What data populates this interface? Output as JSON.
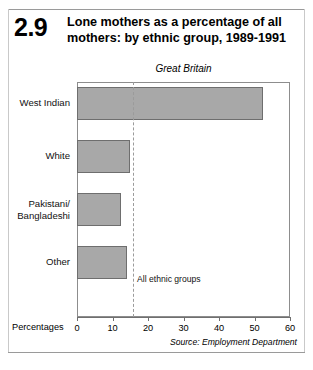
{
  "figure": {
    "number": "2.9",
    "title": "Lone mothers as a percentage of all mothers: by ethnic group, 1989-1991",
    "subtitle": "Great Britain",
    "source": "Source: Employment Department"
  },
  "axis": {
    "x_title": "Percentages",
    "tick_labels": [
      "0",
      "10",
      "20",
      "30",
      "40",
      "50",
      "60"
    ]
  },
  "annotation": {
    "label": "All ethnic groups"
  },
  "colors": {
    "bar_fill": "#a8a8a8",
    "bar_border": "#6e6e6e",
    "frame": "#8d8d8d",
    "reference_line": "#9b9b9b"
  },
  "chart_data": {
    "type": "bar",
    "orientation": "horizontal",
    "title": "Lone mothers as a percentage of all mothers: by ethnic group, 1989-1991",
    "subtitle": "Great Britain",
    "xlabel": "Percentages",
    "ylabel": "",
    "xlim": [
      0,
      60
    ],
    "xticks": [
      0,
      10,
      20,
      30,
      40,
      50,
      60
    ],
    "grid": false,
    "legend": false,
    "categories": [
      "West Indian",
      "White",
      "Pakistani/\nBangladeshi",
      "Other"
    ],
    "values": [
      52.5,
      15.0,
      12.5,
      14.0
    ],
    "reference_line": {
      "label": "All ethnic groups",
      "value": 15.8
    },
    "source": "Source: Employment Department"
  }
}
